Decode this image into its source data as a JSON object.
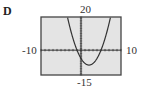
{
  "panel": {
    "label": "D"
  },
  "axes": {
    "ymax_label": "20",
    "ymin_label": "-15",
    "xmin_label": "-10",
    "xmax_label": "10"
  },
  "colors": {
    "plot_background": "#e4e4e4",
    "frame": "#444444",
    "curve": "#333333"
  },
  "chart_data": {
    "type": "line",
    "title": "D",
    "xlabel": "",
    "ylabel": "",
    "xlim": [
      -10,
      10
    ],
    "ylim": [
      -15,
      20
    ],
    "grid": false,
    "axis_ticks": "dotted tick marks along both axes at unit spacing",
    "legend": null,
    "tick_labels": {
      "x": [
        "-10",
        "10"
      ],
      "y": [
        "-15",
        "20"
      ]
    },
    "series": [
      {
        "name": "y = x^2 - 4x - 5",
        "x": [
          -2.5,
          -2,
          -1,
          0,
          1,
          2,
          3,
          4,
          5,
          6,
          6.5
        ],
        "y": [
          6.25,
          7,
          0,
          -5,
          -8,
          -9,
          -8,
          -5,
          0,
          7,
          11.25
        ]
      }
    ],
    "annotations": {
      "x_intercepts": [
        -1,
        5
      ],
      "y_intercept": -5,
      "vertex": [
        2,
        -9
      ]
    }
  }
}
